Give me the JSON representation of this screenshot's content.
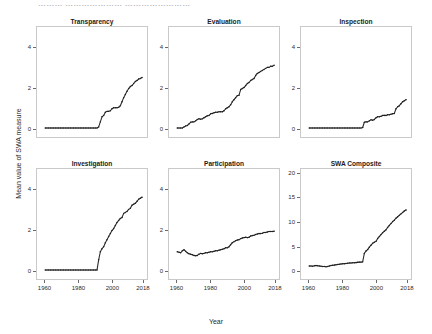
{
  "figure": {
    "cut_title_fragment": "………  …………………  ……………………",
    "ylabel": "Mean value of SWA measure",
    "xlabel": "Year"
  },
  "chart_data": [
    {
      "type": "line",
      "title": "Transparency",
      "xlabel": "Year",
      "ylabel": "Mean value of SWA measure",
      "xlim": [
        1955,
        2021
      ],
      "ylim": [
        -0.45,
        5.0
      ],
      "xticks": [
        1960,
        1980,
        2000,
        2018
      ],
      "yticks": [
        0,
        2,
        4
      ],
      "grid": false,
      "legend": "none",
      "x": [
        1960,
        1961,
        1962,
        1963,
        1964,
        1965,
        1966,
        1967,
        1968,
        1969,
        1970,
        1971,
        1972,
        1973,
        1974,
        1975,
        1976,
        1977,
        1978,
        1979,
        1980,
        1981,
        1982,
        1983,
        1984,
        1985,
        1986,
        1987,
        1988,
        1989,
        1990,
        1991,
        1992,
        1993,
        1994,
        1995,
        1996,
        1997,
        1998,
        1999,
        2000,
        2001,
        2002,
        2003,
        2004,
        2005,
        2006,
        2007,
        2008,
        2009,
        2010,
        2011,
        2012,
        2013,
        2014,
        2015,
        2016,
        2017,
        2018
      ],
      "values": [
        0,
        0,
        0,
        0,
        0,
        0,
        0,
        0,
        0,
        0,
        0,
        0,
        0,
        0,
        0,
        0,
        0,
        0,
        0,
        0,
        0,
        0,
        0,
        0,
        0,
        0,
        0,
        0,
        0,
        0,
        0,
        0,
        0.05,
        0.3,
        0.55,
        0.62,
        0.78,
        0.82,
        0.82,
        0.85,
        0.95,
        1.0,
        1.0,
        1.0,
        1.02,
        1.1,
        1.3,
        1.5,
        1.65,
        1.82,
        1.95,
        2.05,
        2.1,
        2.2,
        2.3,
        2.35,
        2.42,
        2.45,
        2.5
      ]
    },
    {
      "type": "line",
      "title": "Evaluation",
      "xlabel": "Year",
      "ylabel": "Mean value of SWA measure",
      "xlim": [
        1955,
        2021
      ],
      "ylim": [
        -0.45,
        5.0
      ],
      "xticks": [
        1960,
        1980,
        2000,
        2018
      ],
      "yticks": [
        0,
        2,
        4
      ],
      "grid": false,
      "legend": "none",
      "x": [
        1960,
        1961,
        1962,
        1963,
        1964,
        1965,
        1966,
        1967,
        1968,
        1969,
        1970,
        1971,
        1972,
        1973,
        1974,
        1975,
        1976,
        1977,
        1978,
        1979,
        1980,
        1981,
        1982,
        1983,
        1984,
        1985,
        1986,
        1987,
        1988,
        1989,
        1990,
        1991,
        1992,
        1993,
        1994,
        1995,
        1996,
        1997,
        1998,
        1999,
        2000,
        2001,
        2002,
        2003,
        2004,
        2005,
        2006,
        2007,
        2008,
        2009,
        2010,
        2011,
        2012,
        2013,
        2014,
        2015,
        2016,
        2017,
        2018
      ],
      "values": [
        0,
        0,
        0,
        0,
        0.05,
        0.1,
        0.12,
        0.2,
        0.28,
        0.3,
        0.3,
        0.35,
        0.42,
        0.45,
        0.43,
        0.45,
        0.5,
        0.55,
        0.6,
        0.62,
        0.7,
        0.72,
        0.75,
        0.78,
        0.78,
        0.8,
        0.8,
        0.8,
        0.85,
        0.95,
        1.0,
        1.05,
        1.15,
        1.3,
        1.4,
        1.5,
        1.6,
        1.62,
        1.9,
        1.95,
        2.0,
        2.1,
        2.2,
        2.25,
        2.35,
        2.4,
        2.45,
        2.6,
        2.7,
        2.75,
        2.8,
        2.85,
        2.9,
        2.95,
        3.0,
        3.0,
        3.05,
        3.05,
        3.1
      ]
    },
    {
      "type": "line",
      "title": "Inspection",
      "xlabel": "Year",
      "ylabel": "Mean value of SWA measure",
      "xlim": [
        1955,
        2021
      ],
      "ylim": [
        -0.45,
        5.0
      ],
      "xticks": [
        1960,
        1980,
        2000,
        2018
      ],
      "yticks": [
        0,
        2,
        4
      ],
      "grid": false,
      "legend": "none",
      "x": [
        1960,
        1961,
        1962,
        1963,
        1964,
        1965,
        1966,
        1967,
        1968,
        1969,
        1970,
        1971,
        1972,
        1973,
        1974,
        1975,
        1976,
        1977,
        1978,
        1979,
        1980,
        1981,
        1982,
        1983,
        1984,
        1985,
        1986,
        1987,
        1988,
        1989,
        1990,
        1991,
        1992,
        1993,
        1994,
        1995,
        1996,
        1997,
        1998,
        1999,
        2000,
        2001,
        2002,
        2003,
        2004,
        2005,
        2006,
        2007,
        2008,
        2009,
        2010,
        2011,
        2012,
        2013,
        2014,
        2015,
        2016,
        2017,
        2018
      ],
      "values": [
        0,
        0,
        0,
        0,
        0,
        0,
        0,
        0,
        0,
        0,
        0,
        0,
        0,
        0,
        0,
        0,
        0,
        0,
        0,
        0,
        0,
        0,
        0,
        0,
        0,
        0,
        0,
        0,
        0,
        0,
        0,
        0,
        0.02,
        0.28,
        0.3,
        0.3,
        0.35,
        0.4,
        0.38,
        0.42,
        0.5,
        0.55,
        0.55,
        0.58,
        0.62,
        0.62,
        0.62,
        0.65,
        0.65,
        0.68,
        0.7,
        0.72,
        0.95,
        1.05,
        1.1,
        1.2,
        1.3,
        1.35,
        1.4
      ]
    },
    {
      "type": "line",
      "title": "Investigation",
      "xlabel": "Year",
      "ylabel": "Mean value of SWA measure",
      "xlim": [
        1955,
        2021
      ],
      "ylim": [
        -0.45,
        5.0
      ],
      "xticks": [
        1960,
        1980,
        2000,
        2018
      ],
      "yticks": [
        0,
        2,
        4
      ],
      "grid": false,
      "legend": "none",
      "x": [
        1960,
        1961,
        1962,
        1963,
        1964,
        1965,
        1966,
        1967,
        1968,
        1969,
        1970,
        1971,
        1972,
        1973,
        1974,
        1975,
        1976,
        1977,
        1978,
        1979,
        1980,
        1981,
        1982,
        1983,
        1984,
        1985,
        1986,
        1987,
        1988,
        1989,
        1990,
        1991,
        1992,
        1993,
        1994,
        1995,
        1996,
        1997,
        1998,
        1999,
        2000,
        2001,
        2002,
        2003,
        2004,
        2005,
        2006,
        2007,
        2008,
        2009,
        2010,
        2011,
        2012,
        2013,
        2014,
        2015,
        2016,
        2017,
        2018
      ],
      "values": [
        0,
        0,
        0,
        0,
        0,
        0,
        0,
        0,
        0,
        0,
        0,
        0,
        0,
        0,
        0,
        0,
        0,
        0,
        0,
        0,
        0,
        0,
        0,
        0,
        0,
        0,
        0,
        0,
        0,
        0,
        0,
        0,
        0.5,
        0.9,
        1.05,
        1.15,
        1.35,
        1.5,
        1.65,
        1.8,
        1.95,
        2.05,
        2.2,
        2.35,
        2.45,
        2.55,
        2.6,
        2.8,
        2.85,
        2.9,
        3.0,
        3.05,
        3.2,
        3.25,
        3.3,
        3.4,
        3.5,
        3.55,
        3.6
      ]
    },
    {
      "type": "line",
      "title": "Participation",
      "xlabel": "Year",
      "ylabel": "Mean value of SWA measure",
      "xlim": [
        1955,
        2021
      ],
      "ylim": [
        -0.45,
        5.0
      ],
      "xticks": [
        1960,
        1980,
        2000,
        2018
      ],
      "yticks": [
        0,
        2,
        4
      ],
      "grid": false,
      "legend": "none",
      "x": [
        1960,
        1961,
        1962,
        1963,
        1964,
        1965,
        1966,
        1967,
        1968,
        1969,
        1970,
        1971,
        1972,
        1973,
        1974,
        1975,
        1976,
        1977,
        1978,
        1979,
        1980,
        1981,
        1982,
        1983,
        1984,
        1985,
        1986,
        1987,
        1988,
        1989,
        1990,
        1991,
        1992,
        1993,
        1994,
        1995,
        1996,
        1997,
        1998,
        1999,
        2000,
        2001,
        2002,
        2003,
        2004,
        2005,
        2006,
        2007,
        2008,
        2009,
        2010,
        2011,
        2012,
        2013,
        2014,
        2015,
        2016,
        2017,
        2018
      ],
      "values": [
        0.9,
        0.88,
        0.85,
        0.95,
        1.0,
        0.92,
        0.85,
        0.8,
        0.78,
        0.75,
        0.72,
        0.7,
        0.72,
        0.78,
        0.82,
        0.8,
        0.82,
        0.85,
        0.85,
        0.88,
        0.9,
        0.9,
        0.92,
        0.95,
        0.95,
        0.98,
        1.0,
        1.02,
        1.05,
        1.1,
        1.1,
        1.15,
        1.25,
        1.35,
        1.4,
        1.45,
        1.48,
        1.5,
        1.55,
        1.58,
        1.6,
        1.62,
        1.6,
        1.62,
        1.68,
        1.7,
        1.72,
        1.75,
        1.78,
        1.8,
        1.8,
        1.82,
        1.85,
        1.85,
        1.88,
        1.9,
        1.9,
        1.9,
        1.92
      ]
    },
    {
      "type": "line",
      "title": "SWA Composite",
      "xlabel": "Year",
      "ylabel": "Mean value of SWA measure",
      "xlim": [
        1955,
        2021
      ],
      "ylim": [
        -1.8,
        21.0
      ],
      "xticks": [
        1960,
        1980,
        2000,
        2018
      ],
      "yticks": [
        0,
        5,
        10,
        15,
        20
      ],
      "grid": false,
      "legend": "none",
      "x": [
        1960,
        1961,
        1962,
        1963,
        1964,
        1965,
        1966,
        1967,
        1968,
        1969,
        1970,
        1971,
        1972,
        1973,
        1974,
        1975,
        1976,
        1977,
        1978,
        1979,
        1980,
        1981,
        1982,
        1983,
        1984,
        1985,
        1986,
        1987,
        1988,
        1989,
        1990,
        1991,
        1992,
        1993,
        1994,
        1995,
        1996,
        1997,
        1998,
        1999,
        2000,
        2001,
        2002,
        2003,
        2004,
        2005,
        2006,
        2007,
        2008,
        2009,
        2010,
        2011,
        2012,
        2013,
        2014,
        2015,
        2016,
        2017,
        2018
      ],
      "values": [
        0.9,
        0.9,
        0.85,
        0.95,
        1.0,
        0.95,
        0.9,
        0.85,
        0.8,
        0.78,
        0.75,
        0.8,
        0.9,
        1.0,
        1.05,
        1.08,
        1.15,
        1.2,
        1.25,
        1.3,
        1.35,
        1.38,
        1.4,
        1.45,
        1.5,
        1.5,
        1.55,
        1.55,
        1.6,
        1.65,
        1.7,
        1.7,
        1.75,
        3.5,
        4.0,
        4.3,
        4.8,
        5.2,
        5.6,
        5.8,
        6.0,
        6.6,
        7.0,
        7.4,
        7.8,
        8.1,
        8.4,
        8.9,
        9.3,
        9.7,
        10.1,
        10.4,
        10.8,
        11.1,
        11.4,
        11.7,
        12.0,
        12.3,
        12.5
      ]
    }
  ]
}
